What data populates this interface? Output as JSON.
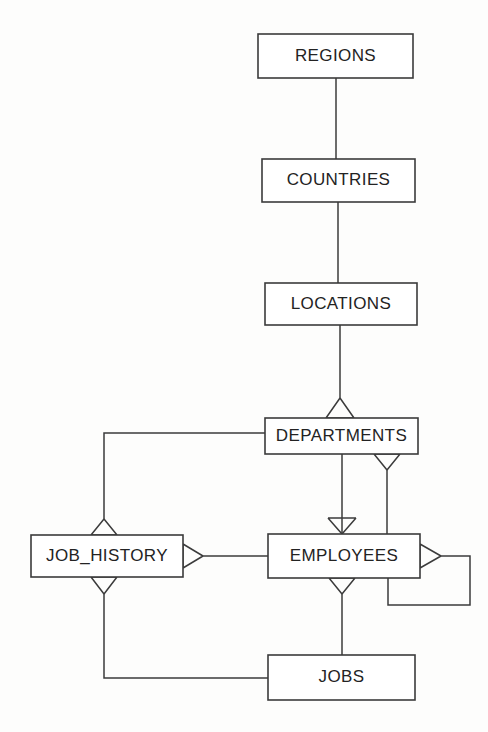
{
  "diagram": {
    "notation": "crow's foot",
    "background_color": "#fdfdfc",
    "line_color": "#3b3b3b",
    "text_color": "#232323",
    "entities": [
      {
        "id": "regions",
        "label": "REGIONS",
        "x": 258,
        "y": 34,
        "w": 155,
        "h": 44
      },
      {
        "id": "countries",
        "label": "COUNTRIES",
        "x": 262,
        "y": 159,
        "w": 153,
        "h": 43
      },
      {
        "id": "locations",
        "label": "LOCATIONS",
        "x": 265,
        "y": 283,
        "w": 152,
        "h": 42
      },
      {
        "id": "departments",
        "label": "DEPARTMENTS",
        "x": 265,
        "y": 418,
        "w": 153,
        "h": 36
      },
      {
        "id": "job_history",
        "label": "JOB_HISTORY",
        "x": 31,
        "y": 535,
        "w": 152,
        "h": 42
      },
      {
        "id": "employees",
        "label": "EMPLOYEES",
        "x": 268,
        "y": 534,
        "w": 152,
        "h": 44
      },
      {
        "id": "jobs",
        "label": "JOBS",
        "x": 268,
        "y": 655,
        "w": 147,
        "h": 45
      }
    ],
    "relationships": [
      {
        "id": "regions-countries",
        "from": "regions",
        "to": "countries",
        "many_at": "countries"
      },
      {
        "id": "countries-locations",
        "from": "countries",
        "to": "locations",
        "many_at": "locations"
      },
      {
        "id": "locations-departments",
        "from": "locations",
        "to": "departments",
        "many_at": "departments"
      },
      {
        "id": "departments-employees",
        "from": "departments",
        "to": "employees",
        "many_at": "employees"
      },
      {
        "id": "employees-departments",
        "from": "employees",
        "to": "departments",
        "many_at": "departments"
      },
      {
        "id": "departments-job-history",
        "from": "departments",
        "to": "job_history",
        "many_at": "job_history"
      },
      {
        "id": "employees-job-history",
        "from": "employees",
        "to": "job_history",
        "many_at": "job_history"
      },
      {
        "id": "jobs-job-history",
        "from": "jobs",
        "to": "job_history",
        "many_at": "job_history"
      },
      {
        "id": "jobs-employees",
        "from": "jobs",
        "to": "employees",
        "many_at": "employees"
      },
      {
        "id": "employees-manager-self",
        "from": "employees",
        "to": "employees",
        "many_at": "employees"
      }
    ]
  }
}
